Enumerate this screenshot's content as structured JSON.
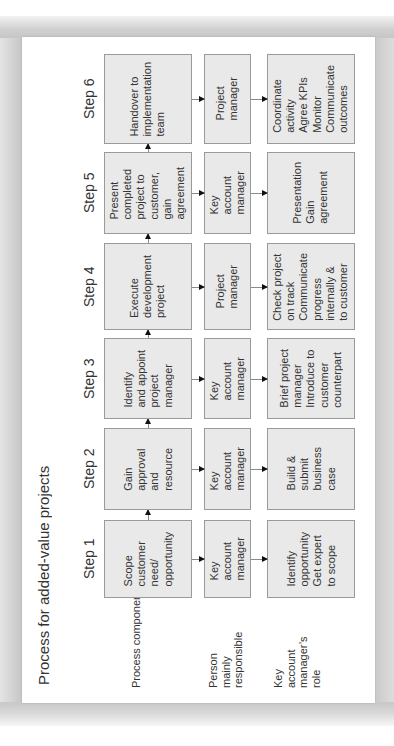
{
  "title": "Process for added-value projects",
  "row_labels": {
    "process": "Process component",
    "person": "Person mainly responsible",
    "role": "Key account manager’s role"
  },
  "steps": [
    {
      "label": "Step 1",
      "process": [
        "Scope",
        "customer",
        "need/",
        "opportunity"
      ],
      "person": [
        "Key",
        "account",
        "manager"
      ],
      "role": [
        "Identify",
        "opportunity",
        "Get expert",
        "to scope"
      ]
    },
    {
      "label": "Step 2",
      "process": [
        "Gain",
        "approval",
        "and",
        "resource"
      ],
      "person": [
        "Key",
        "account",
        "manager"
      ],
      "role": [
        "Build &",
        "submit",
        "business",
        "case"
      ]
    },
    {
      "label": "Step 3",
      "process": [
        "Identify",
        "and appoint",
        "project",
        "manager"
      ],
      "person": [
        "Key",
        "account",
        "manager"
      ],
      "role": [
        "Brief project",
        "manager",
        "Introduce to",
        "customer",
        "counterpart"
      ]
    },
    {
      "label": "Step 4",
      "process": [
        "Execute",
        "development",
        "project"
      ],
      "person": [
        "Project",
        "manager"
      ],
      "role": [
        "Check project",
        "on track",
        "Communicate",
        "progress",
        "internally &",
        "to customer"
      ]
    },
    {
      "label": "Step 5",
      "process": [
        "Present",
        "completed",
        "project to",
        "customer,",
        "gain",
        "agreement"
      ],
      "person": [
        "Key",
        "account",
        "manager"
      ],
      "role": [
        "Presentation",
        "Gain",
        "agreement"
      ]
    },
    {
      "label": "Step 6",
      "process": [
        "Handover to",
        "implementation",
        "team"
      ],
      "person": [
        "Project",
        "manager"
      ],
      "role": [
        "Coordinate",
        "activity",
        "Agree KPIs",
        "Monitor",
        "Communicate",
        "outcomes"
      ]
    }
  ]
}
